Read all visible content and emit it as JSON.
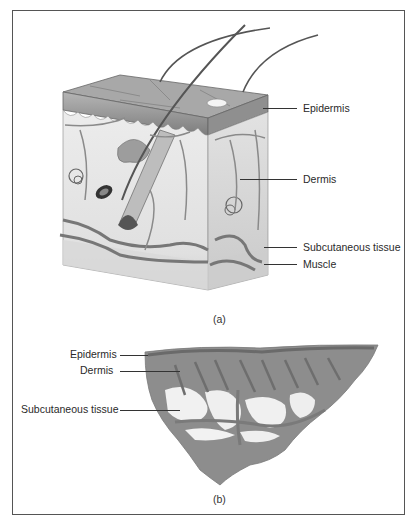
{
  "figure": {
    "panel_a": {
      "caption": "(a)",
      "type": "illustration-skin-block-cross-section",
      "labels": [
        {
          "text": "Epidermis"
        },
        {
          "text": "Dermis"
        },
        {
          "text": "Subcutaneous tissue"
        },
        {
          "text": "Muscle"
        }
      ]
    },
    "panel_b": {
      "caption": "(b)",
      "type": "micrograph-skin-section",
      "labels": [
        {
          "text": "Epidermis"
        },
        {
          "text": "Dermis"
        },
        {
          "text": "Subcutaneous tissue"
        }
      ]
    }
  },
  "colors": {
    "border": "#555555",
    "ink": "#2a2a2a",
    "epidermis_fill": "#9a9a9a",
    "dermis_fill": "#e4e4e4",
    "tissue_fill": "#8a8a8a"
  }
}
